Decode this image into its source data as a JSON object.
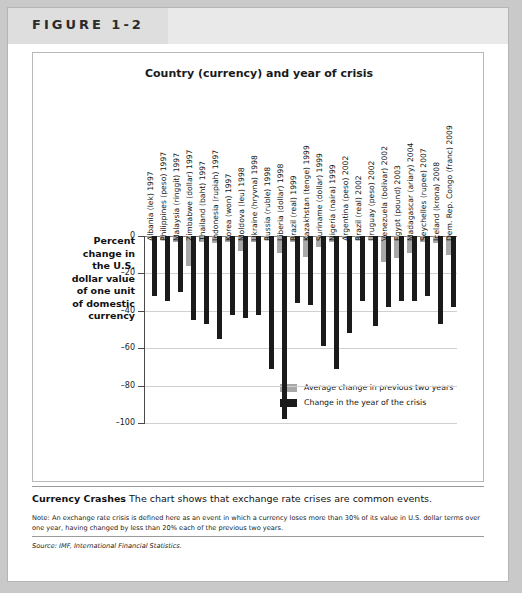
{
  "figure": {
    "label": "FIGURE 1-2"
  },
  "caption": {
    "title": "Currency Crashes",
    "text": "The chart shows that exchange rate crises are common events.",
    "note": "Note: An exchange rate crisis is defined here as an event in which a currency loses more than 30% of its value in U.S. dollar terms over one year, having changed by less than 20% each of the previous two years.",
    "source": "Source: IMF, International Financial Statistics."
  },
  "colors": {
    "crisis_bar": "#1b1b1b",
    "average_bar": "#a8a8a8",
    "axis": "#4a4a4a",
    "grid": "#d0d0d0",
    "header_band": "#e9e9e9",
    "page_background": "#c9c9c9"
  },
  "chart_data": {
    "type": "bar",
    "title": "Country (currency) and year of crisis",
    "xlabel": "",
    "ylabel": "Percent change in the U.S. dollar value of one unit of domestic currency",
    "ylim": [
      -100,
      0
    ],
    "yticks": [
      0,
      -20,
      -40,
      -60,
      -80,
      -100
    ],
    "ytick_labels": [
      "0",
      "–20",
      "–40",
      "–60",
      "–80",
      "–100"
    ],
    "grid": true,
    "legend_position": "inside-bottom-right",
    "categories": [
      "Albania (lek) 1997",
      "Philippines (peso) 1997",
      "Malaysia (ringgit) 1997",
      "Zimbabwe (dollar) 1997",
      "Thailand (baht) 1997",
      "Indonesia (rupiah) 1997",
      "Korea (won) 1997",
      "Moldova (leu) 1998",
      "Ukraine (hryvna) 1998",
      "Russia (ruble) 1998",
      "Liberia (dollar) 1998",
      "Brazil (real) 1999",
      "Kazakhstan (tenge) 1999",
      "Suriname (dollar) 1999",
      "Nigeria (naira) 1999",
      "Argentina (peso) 2002",
      "Brazil (real) 2002",
      "Uruguay (peso) 2002",
      "Venezuela (bolivar) 2002",
      "Egypt (pound) 2003",
      "Madagascar (ariary) 2004",
      "Seychelles (rupee) 2007",
      "Iceland (krona) 2008",
      "Dem. Rep. Congo (franc) 2009"
    ],
    "series": [
      {
        "name": "Average change in previous two years",
        "color": "#a8a8a8",
        "values": [
          -1,
          -2,
          -3,
          -16,
          -3,
          -4,
          -3,
          -8,
          -3,
          -2,
          -9,
          -3,
          -11,
          -6,
          -3,
          -1,
          -2,
          -2,
          -14,
          -12,
          -9,
          -3,
          -4,
          -10
        ]
      },
      {
        "name": "Change in the year of the crisis",
        "color": "#1b1b1b",
        "values": [
          -32,
          -35,
          -30,
          -45,
          -47,
          -55,
          -42,
          -44,
          -42,
          -71,
          -98,
          -36,
          -37,
          -59,
          -71,
          -52,
          -35,
          -48,
          -38,
          -35,
          -35,
          -32,
          -47,
          -38
        ]
      }
    ],
    "legend": [
      "Average change in previous two years",
      "Change in the year of the crisis"
    ]
  }
}
